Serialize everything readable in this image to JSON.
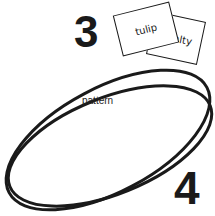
{
  "numerals": {
    "first": "3",
    "second": "4"
  },
  "cards": [
    {
      "text": "tulip"
    },
    {
      "text": "alty"
    }
  ],
  "shape": {
    "label": "pattern"
  },
  "colors": {
    "ink": "#1a1a1a",
    "background": "#ffffff"
  }
}
